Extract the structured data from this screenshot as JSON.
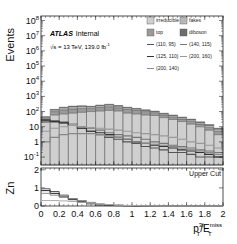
{
  "chart_data": {
    "type": "bar",
    "subtitle": "√s = 13 TeV, 139.0 fb⁻¹",
    "xlabel": "p_T^3l/E_T^miss",
    "ylabel": "Events",
    "xlim": [
      0,
      2
    ],
    "ylim": [
      0.03,
      100000000.0
    ],
    "yscale": "log",
    "x_ticks": [
      "0",
      "0.2",
      "0.4",
      "0.6",
      "0.8",
      "1",
      "1.2",
      "1.4",
      "1.6",
      "1.8",
      "2"
    ],
    "y_ticks": [
      "10⁻¹",
      "1",
      "10",
      "10²",
      "10³",
      "10⁴",
      "10⁵",
      "10⁶",
      "10⁷",
      "10⁸"
    ],
    "bins": [
      0,
      0.1,
      0.2,
      0.3,
      0.4,
      0.5,
      0.6,
      0.7,
      0.8,
      0.9,
      1.0,
      1.1,
      1.2,
      1.3,
      1.4,
      1.5,
      1.6,
      1.7,
      1.8,
      1.9,
      2.0
    ],
    "stack": [
      {
        "name": "irreducible",
        "color": "#cfcfcf",
        "values": [
          25,
          60,
          70,
          80,
          90,
          100,
          110,
          120,
          110,
          80,
          70,
          60,
          55,
          40,
          30,
          22,
          15,
          10,
          6,
          3
        ]
      },
      {
        "name": "top",
        "color": "#9a9a9a",
        "values": [
          10,
          40,
          60,
          70,
          70,
          60,
          80,
          90,
          70,
          60,
          50,
          40,
          30,
          20,
          15,
          10,
          8,
          5,
          3,
          2
        ]
      },
      {
        "name": "fakes",
        "color": "#b8b8b8",
        "values": [
          8,
          30,
          50,
          60,
          60,
          50,
          60,
          70,
          50,
          40,
          30,
          20,
          15,
          12,
          10,
          8,
          6,
          4,
          3,
          2
        ]
      },
      {
        "name": "diboson",
        "color": "#6d6d6d",
        "values": [
          3,
          10,
          15,
          20,
          20,
          15,
          20,
          25,
          20,
          15,
          12,
          10,
          8,
          6,
          5,
          4,
          3,
          2,
          2,
          1
        ]
      }
    ],
    "signals": [
      {
        "name": "(110, 95)",
        "color": "#555555",
        "values": [
          30,
          25,
          20,
          12,
          8,
          5,
          3,
          2,
          1.5,
          1,
          0.8,
          0.5,
          0.4,
          0.3,
          0.2,
          0.2,
          0.15,
          0.1,
          0.1,
          0.1
        ]
      },
      {
        "name": "(140, 115)",
        "color": "#777777",
        "values": [
          20,
          20,
          18,
          15,
          10,
          8,
          6,
          4,
          3,
          2.5,
          2,
          1.5,
          1,
          0.8,
          0.6,
          0.5,
          0.4,
          0.3,
          0.25,
          0.2
        ]
      },
      {
        "name": "(125, 110)",
        "color": "#333333",
        "values": [
          25,
          22,
          18,
          12,
          8,
          5,
          4,
          3,
          2,
          1.5,
          1,
          0.8,
          0.6,
          0.5,
          0.4,
          0.3,
          0.25,
          0.2,
          0.15,
          0.1
        ]
      },
      {
        "name": "(200, 160)",
        "color": "#999999",
        "values": [
          5,
          8,
          10,
          12,
          10,
          9,
          8,
          7,
          6,
          5,
          4,
          3.5,
          3,
          2.5,
          2,
          1.5,
          1,
          0.8,
          0.6,
          0.4
        ]
      },
      {
        "name": "(200, 140)",
        "color": "#888888",
        "values": [
          1,
          2,
          3,
          3.5,
          3.5,
          3.5,
          3,
          2.5,
          2,
          1.5,
          1,
          0.8,
          0.7,
          0.6,
          0.5,
          0.4,
          0.3,
          0.25,
          0.2,
          0.15
        ]
      }
    ],
    "lower_panel": {
      "ylabel": "Zn",
      "ylim": [
        0,
        2
      ],
      "y_ticks": [
        "0",
        "1",
        "2"
      ],
      "annotation": "Upper Cut",
      "series": [
        {
          "name": "(110, 95)",
          "values": [
            0.95,
            0.8,
            0.6,
            0.4,
            0.25,
            0.15,
            0.08,
            0.05,
            0.03,
            0.02,
            0.01,
            0,
            0,
            0,
            0,
            0,
            0,
            0,
            0,
            0
          ]
        },
        {
          "name": "(125, 110)",
          "values": [
            0.85,
            0.7,
            0.5,
            0.35,
            0.2,
            0.12,
            0.06,
            0.04,
            0.02,
            0.01,
            0,
            0,
            0,
            0,
            0,
            0,
            0,
            0,
            0,
            0
          ]
        },
        {
          "name": "(140, 115)",
          "values": [
            0.7,
            0.6,
            0.5,
            0.4,
            0.3,
            0.2,
            0.12,
            0.08,
            0.05,
            0.03,
            0.02,
            0.01,
            0,
            0,
            0,
            0,
            0,
            0,
            0,
            0
          ]
        },
        {
          "name": "(200, 160)",
          "values": [
            0.3,
            0.3,
            0.28,
            0.25,
            0.2,
            0.15,
            0.1,
            0.07,
            0.05,
            0.03,
            0.02,
            0.01,
            0.01,
            0,
            0,
            0,
            0,
            0,
            0,
            0
          ]
        }
      ]
    },
    "legend": [
      {
        "label": "irreducible",
        "kind": "fill",
        "color": "#cfcfcf"
      },
      {
        "label": "fakes",
        "kind": "fill",
        "color": "#b8b8b8"
      },
      {
        "label": "top",
        "kind": "fill",
        "color": "#9a9a9a"
      },
      {
        "label": "diboson",
        "kind": "fill",
        "color": "#6d6d6d"
      },
      {
        "label": "(110, 95)",
        "kind": "line",
        "color": "#555555"
      },
      {
        "label": "(140, 115)",
        "kind": "line",
        "color": "#777777"
      },
      {
        "label": "(125, 110)",
        "kind": "line",
        "color": "#333333"
      },
      {
        "label": "(200, 160)",
        "kind": "line",
        "color": "#999999"
      },
      {
        "label": "(200, 140)",
        "kind": "line",
        "color": "#888888"
      }
    ],
    "legend_position": "upper right",
    "grid": false
  },
  "labels": {
    "atlas": "ATLAS",
    "internal": "Internal",
    "energy": "√s = 13 TeV, 139.0 fb",
    "energy_sup": "-1",
    "events": "Events",
    "zn": "Zn",
    "upper_cut": "Upper Cut",
    "x_main": "p",
    "x_sup": "3l",
    "x_sub": "T",
    "x_div": "/E",
    "x_sup2": "miss",
    "x_sub2": "T"
  }
}
